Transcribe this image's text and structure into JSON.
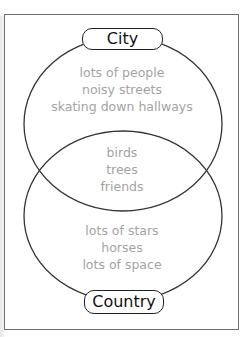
{
  "diagram": {
    "type": "venn",
    "sets": [
      {
        "label": "City",
        "items": [
          "lots of people",
          "noisy streets",
          "skating down hallways"
        ]
      },
      {
        "label": "Country",
        "items": [
          "lots of stars",
          "horses",
          "lots of space"
        ]
      }
    ],
    "intersection": {
      "items": [
        "birds",
        "trees",
        "friends"
      ]
    },
    "colors": {
      "outline": "#333333",
      "item_text": "#a3a3a3",
      "label_text": "#111111"
    }
  }
}
